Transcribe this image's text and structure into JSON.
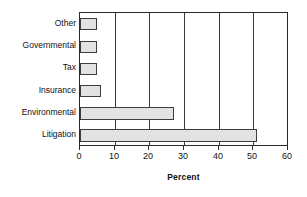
{
  "chart_data": {
    "type": "bar",
    "orientation": "horizontal",
    "title": "",
    "categories": [
      "Litigation",
      "Environmental",
      "Insurance",
      "Tax",
      "Governmental",
      "Other"
    ],
    "values": [
      51,
      27,
      6,
      5,
      5,
      5
    ],
    "xlabel": "Percent",
    "ylabel": "",
    "xlim": [
      0,
      60
    ],
    "xticks": [
      0,
      10,
      20,
      30,
      40,
      50,
      60
    ],
    "xtick_labels": [
      "0",
      "10",
      "20",
      "30",
      "40",
      "50",
      "60"
    ],
    "grid": "vertical",
    "legend": "none",
    "bar_fill_color": "#e2e2e2",
    "bar_edge_color": "#3d3d3d",
    "axis_color": "#2b2b2b",
    "background_color": "#ffffff",
    "display_order_top_to_bottom": [
      "Other",
      "Governmental",
      "Tax",
      "Insurance",
      "Environmental",
      "Litigation"
    ]
  }
}
